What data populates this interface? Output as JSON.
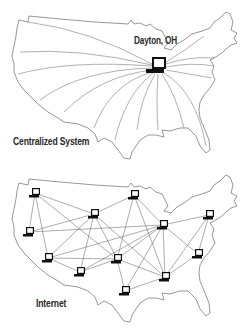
{
  "diagram": {
    "top_panel": {
      "caption": "Centralized System",
      "hub_label": "Dayton, OH",
      "hub": {
        "icon": "computer-icon",
        "x": 158,
        "y": 66
      },
      "ray_count": 15
    },
    "bottom_panel": {
      "caption": "Internet",
      "nodes": [
        {
          "id": "A",
          "icon": "computer-icon",
          "x": 35,
          "y": 26
        },
        {
          "id": "B",
          "icon": "computer-icon",
          "x": 94,
          "y": 47
        },
        {
          "id": "C",
          "icon": "computer-icon",
          "x": 134,
          "y": 28
        },
        {
          "id": "D",
          "icon": "computer-icon",
          "x": 29,
          "y": 65
        },
        {
          "id": "E",
          "icon": "computer-icon",
          "x": 163,
          "y": 58
        },
        {
          "id": "F",
          "icon": "computer-icon",
          "x": 209,
          "y": 48
        },
        {
          "id": "G",
          "icon": "computer-icon",
          "x": 48,
          "y": 91
        },
        {
          "id": "H",
          "icon": "computer-icon",
          "x": 117,
          "y": 92
        },
        {
          "id": "I",
          "icon": "computer-icon",
          "x": 198,
          "y": 87
        },
        {
          "id": "J",
          "icon": "computer-icon",
          "x": 80,
          "y": 105
        },
        {
          "id": "K",
          "icon": "computer-icon",
          "x": 165,
          "y": 110
        },
        {
          "id": "L",
          "icon": "computer-icon",
          "x": 125,
          "y": 124
        }
      ],
      "edges": [
        [
          "A",
          "B"
        ],
        [
          "A",
          "D"
        ],
        [
          "A",
          "G"
        ],
        [
          "A",
          "H"
        ],
        [
          "B",
          "C"
        ],
        [
          "B",
          "D"
        ],
        [
          "B",
          "G"
        ],
        [
          "B",
          "J"
        ],
        [
          "B",
          "H"
        ],
        [
          "B",
          "K"
        ],
        [
          "C",
          "E"
        ],
        [
          "C",
          "H"
        ],
        [
          "C",
          "K"
        ],
        [
          "D",
          "E"
        ],
        [
          "E",
          "F"
        ],
        [
          "E",
          "G"
        ],
        [
          "E",
          "H"
        ],
        [
          "E",
          "K"
        ],
        [
          "E",
          "L"
        ],
        [
          "E",
          "I"
        ],
        [
          "E",
          "J"
        ],
        [
          "F",
          "I"
        ],
        [
          "F",
          "K"
        ],
        [
          "G",
          "H"
        ],
        [
          "G",
          "J"
        ],
        [
          "H",
          "J"
        ],
        [
          "H",
          "L"
        ],
        [
          "H",
          "K"
        ],
        [
          "I",
          "K"
        ],
        [
          "K",
          "L"
        ]
      ]
    },
    "colors": {
      "line": "#6a6a6a",
      "text": "#2a2a2a",
      "background": "#ffffff"
    }
  }
}
